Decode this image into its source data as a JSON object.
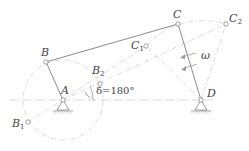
{
  "diagram": {
    "colors": {
      "link": "#8a8a8a",
      "construction": "#c8c8c8",
      "label": "#444444",
      "background": "#ffffff"
    },
    "points": {
      "A": {
        "label": "A",
        "x": 63,
        "y": 100
      },
      "B": {
        "label": "B",
        "x": 46,
        "y": 62
      },
      "B1": {
        "label": "B",
        "sub": "1",
        "x": 28,
        "y": 122
      },
      "B2": {
        "label": "B",
        "sub": "2",
        "x": 100,
        "y": 84
      },
      "C": {
        "label": "C",
        "x": 178,
        "y": 24
      },
      "C1": {
        "label": "C",
        "sub": "1",
        "x": 146,
        "y": 46
      },
      "C2": {
        "label": "C",
        "sub": "2",
        "x": 226,
        "y": 24
      },
      "D": {
        "label": "D",
        "x": 201,
        "y": 100
      }
    },
    "crank_circle": {
      "cx": 63,
      "cy": 100,
      "r": 40
    },
    "angle_label": "δ=180°",
    "omega_label": "ω"
  }
}
